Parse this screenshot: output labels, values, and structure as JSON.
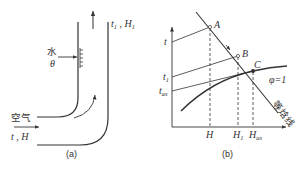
{
  "panel_a": {
    "caption": "(a)",
    "outlet_label_t": "t",
    "outlet_label_t_sub": "1",
    "outlet_label_sep": " , ",
    "outlet_label_H": "H",
    "outlet_label_H_sub": "1",
    "water_label": "水",
    "water_temp_label": "θ",
    "air_label": "空气",
    "inlet_label": "t , H"
  },
  "panel_b": {
    "caption": "(b)",
    "y_labels": {
      "t": "t",
      "t1": "t",
      "t1_sub": "1",
      "tas": "t",
      "tas_sub": "as"
    },
    "x_labels": {
      "H": "H",
      "H1": "H",
      "H1_sub": "1",
      "Has": "H",
      "Has_sub": "as"
    },
    "points": {
      "A": "A",
      "B": "B",
      "C": "C"
    },
    "saturation_label": "φ=1",
    "isenthalpic_label": "等焓线"
  },
  "colors": {
    "ink": "#333333",
    "background": "#ffffff"
  }
}
